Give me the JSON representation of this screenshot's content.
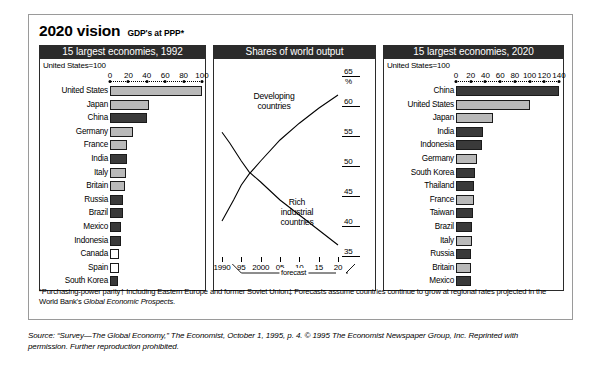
{
  "title": {
    "main": "2020 vision",
    "sub": "GDP's at PPP*"
  },
  "panels": {
    "left": {
      "header": "15 largest economies, 1992",
      "index_note": "United States=100"
    },
    "middle": {
      "header": "Shares of world output"
    },
    "right": {
      "header": "15 largest economies, 2020",
      "index_note": "United States=100"
    }
  },
  "footnote": {
    "line1": "*Purchasing-power parity† Including Eastern Europe and former Soviet Union‡ Forecasts assume countries continue to grow at regional rates",
    "line2_pre": "projected in the World Bank's ",
    "line2_italic": "Global Economic Prospects",
    "line2_post": "."
  },
  "source": {
    "line1": "Source: “Survey—The Global Economy,” The Economist, October 1, 1995, p. 4. © 1995 The Economist Newspaper Group, Inc. Reprinted with",
    "line2": "permission. Further reproduction prohibited."
  },
  "colors": {
    "dark": "#3a3a3a",
    "light": "#b9b9b9",
    "white": "#ffffff",
    "header_bg": "#2b2b2b"
  },
  "chart_data": [
    {
      "type": "bar",
      "title": "15 largest economies, 1992",
      "xlabel": "United States=100",
      "ylabel": "",
      "orientation": "horizontal",
      "xlim": [
        0,
        100
      ],
      "ticks": [
        0,
        20,
        40,
        60,
        80,
        100
      ],
      "grid": false,
      "categories": [
        "United States",
        "Japan",
        "China",
        "Germany",
        "France",
        "India",
        "Italy",
        "Britain",
        "Russia",
        "Brazil",
        "Mexico",
        "Indonesia",
        "Canada",
        "Spain",
        "South Korea"
      ],
      "values": [
        100,
        42,
        40,
        25,
        19,
        18.5,
        17.5,
        16,
        14.5,
        14,
        12,
        11.5,
        10,
        9.5,
        9
      ],
      "fills": [
        "light",
        "light",
        "dark",
        "light",
        "light",
        "dark",
        "light",
        "light",
        "dark",
        "dark",
        "dark",
        "dark",
        "white",
        "white",
        "dark"
      ]
    },
    {
      "type": "line",
      "title": "Shares of world output",
      "xlabel": "forecast",
      "ylabel": "%",
      "ylim": [
        35,
        65
      ],
      "yticks": [
        35,
        40,
        45,
        50,
        55,
        60,
        65
      ],
      "xlim": [
        1990,
        2020
      ],
      "xticks": [
        1990,
        1995,
        2000,
        2005,
        2010,
        2015,
        2020
      ],
      "xticklabels": [
        "1990",
        "95",
        "2000",
        "05",
        "10",
        "15",
        "20"
      ],
      "grid": false,
      "legend_position": "inline-annotation",
      "forecast_from": 1995,
      "series": [
        {
          "name": "Developing countries",
          "x": [
            1990,
            1993,
            1995,
            1997,
            2000,
            2005,
            2010,
            2015,
            2020
          ],
          "values": [
            40.0,
            43.5,
            46.0,
            47.8,
            50.0,
            53.5,
            56.3,
            58.8,
            61.0
          ]
        },
        {
          "name": "Rich industrial countries",
          "x": [
            1990,
            1992,
            1995,
            1997,
            2000,
            2005,
            2010,
            2015,
            2020
          ],
          "values": [
            54.8,
            53.0,
            50.0,
            48.2,
            46.5,
            43.5,
            41.0,
            38.5,
            36.0
          ]
        }
      ]
    },
    {
      "type": "bar",
      "title": "15 largest economies, 2020",
      "xlabel": "United States=100",
      "ylabel": "",
      "orientation": "horizontal",
      "xlim": [
        0,
        140
      ],
      "ticks": [
        0,
        20,
        40,
        60,
        80,
        100,
        120,
        140
      ],
      "grid": false,
      "categories": [
        "China",
        "United States",
        "Japan",
        "India",
        "Indonesia",
        "Germany",
        "South Korea",
        "Thailand",
        "France",
        "Taiwan",
        "Brazil",
        "Italy",
        "Russia",
        "Britain",
        "Mexico"
      ],
      "values": [
        140,
        100,
        50,
        37,
        35,
        28,
        26,
        25,
        24,
        23,
        22,
        21.5,
        21,
        20.5,
        20
      ],
      "fills": [
        "dark",
        "light",
        "light",
        "dark",
        "dark",
        "light",
        "dark",
        "dark",
        "light",
        "dark",
        "dark",
        "light",
        "dark",
        "light",
        "dark"
      ]
    }
  ]
}
